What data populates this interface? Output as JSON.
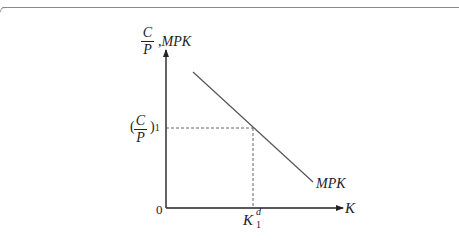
{
  "diagram": {
    "type": "economics-graph",
    "y_axis_label": {
      "fraction_numerator": "C",
      "fraction_denominator": "P",
      "separator": ",",
      "suffix": "MPK"
    },
    "x_axis_label": "K",
    "origin_label": "0",
    "curve_label": "MPK",
    "y_tick_label": {
      "open_paren": "(",
      "fraction_numerator": "C",
      "fraction_denominator": "P",
      "close_paren": ")",
      "subscript": "1"
    },
    "x_tick_label": {
      "base": "K",
      "subscript": "1",
      "superscript": "d"
    },
    "curve": {
      "name": "MPK",
      "start": [
        193,
        72
      ],
      "end": [
        313,
        182
      ],
      "slope": "downward"
    },
    "equilibrium_point": {
      "x_label": "K1d",
      "y_label": "(C/P)1"
    },
    "colors": {
      "axis": "#222222",
      "curve": "#555555",
      "dashed": "#555555",
      "border": "#8a8a8a"
    }
  }
}
